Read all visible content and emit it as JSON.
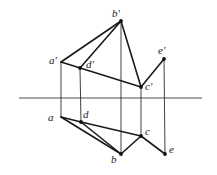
{
  "diagram": {
    "type": "orthographic-projection",
    "colors": {
      "line": "#1a1a1a",
      "background": "#ffffff"
    },
    "axis": {
      "x1": 19,
      "y1": 98,
      "x2": 202,
      "y2": 98
    },
    "points": {
      "b_prime": {
        "label": "b'",
        "x": 121,
        "y": 21,
        "lx": 112,
        "ly": 17
      },
      "a_prime": {
        "label": "a'",
        "x": 61,
        "y": 62,
        "lx": 49,
        "ly": 64
      },
      "d_prime": {
        "label": "d'",
        "x": 80,
        "y": 68,
        "lx": 86,
        "ly": 68
      },
      "c_prime": {
        "label": "c'",
        "x": 141,
        "y": 87,
        "lx": 145,
        "ly": 90
      },
      "e_prime": {
        "label": "e'",
        "x": 164,
        "y": 59,
        "lx": 158,
        "ly": 54
      },
      "a": {
        "label": "a",
        "x": 61,
        "y": 117,
        "lx": 48,
        "ly": 121
      },
      "d": {
        "label": "d",
        "x": 81,
        "y": 122,
        "lx": 83,
        "ly": 118
      },
      "c": {
        "label": "c",
        "x": 141,
        "y": 136,
        "lx": 145,
        "ly": 135
      },
      "b": {
        "label": "b",
        "x": 121,
        "y": 154,
        "lx": 111,
        "ly": 163
      },
      "e": {
        "label": "e",
        "x": 165,
        "y": 154,
        "lx": 169,
        "ly": 153
      }
    },
    "edges": [
      [
        "a_prime",
        "b_prime"
      ],
      [
        "d_prime",
        "b_prime"
      ],
      [
        "b_prime",
        "c_prime"
      ],
      [
        "a_prime",
        "c_prime"
      ],
      [
        "c_prime",
        "e_prime"
      ],
      [
        "a",
        "d"
      ],
      [
        "a",
        "b"
      ],
      [
        "d",
        "b"
      ],
      [
        "d",
        "c"
      ],
      [
        "b",
        "c"
      ],
      [
        "c",
        "e"
      ]
    ],
    "projectors": [
      [
        "a_prime",
        "a"
      ],
      [
        "d_prime",
        "d"
      ],
      [
        "b_prime",
        "b"
      ],
      [
        "c_prime",
        "c"
      ],
      [
        "e_prime",
        "e"
      ]
    ],
    "dots": [
      "b_prime",
      "d_prime",
      "c_prime",
      "e_prime",
      "d",
      "c",
      "b",
      "e"
    ]
  }
}
